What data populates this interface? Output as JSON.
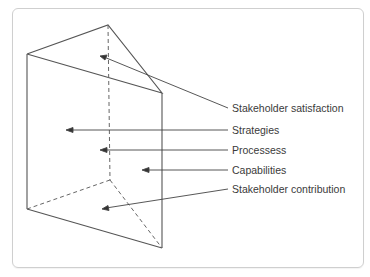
{
  "diagram": {
    "type": "prism",
    "labels": [
      {
        "text": "Stakeholder satisfaction",
        "x": 232,
        "y": 104
      },
      {
        "text": "Strategies",
        "x": 232,
        "y": 124
      },
      {
        "text": "Processess",
        "x": 232,
        "y": 144
      },
      {
        "text": "Capabilities",
        "x": 232,
        "y": 163
      },
      {
        "text": "Stakeholder contribution",
        "x": 232,
        "y": 183
      }
    ],
    "colors": {
      "line": "#555555",
      "frame": "#cfcfcf",
      "text": "#3a3a3a"
    }
  }
}
